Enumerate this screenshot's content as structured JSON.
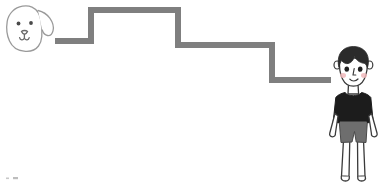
{
  "scene": {
    "title": "Illustration of a dog and a boy separated by a descending step line",
    "width": 387,
    "height": 185,
    "background_color": "#ffffff",
    "caption": ""
  },
  "palette": {
    "step_line": "#7f7f7f",
    "outline": "#3a3a3a",
    "sketch_outline": "#9a9a9a",
    "hair": "#2b2b2b",
    "shirt": "#1c1c1c",
    "shorts": "#6e6e6e",
    "skin": "#fdfdfd",
    "cheek": "#f0b9bb",
    "eye": "#202020",
    "white": "#ffffff"
  },
  "step_line": {
    "name": "step-line",
    "stroke_color": "#7f7f7f",
    "stroke_width": 6,
    "points": [
      [
        55,
        41
      ],
      [
        91,
        41
      ],
      [
        91,
        10
      ],
      [
        178,
        10
      ],
      [
        178,
        45
      ],
      [
        272,
        45
      ],
      [
        272,
        80
      ],
      [
        331,
        80
      ]
    ],
    "steps_down": 3
  },
  "dog": {
    "name": "dog",
    "label": "dog-head",
    "position": {
      "x": 4,
      "y": 4,
      "width": 52,
      "height": 48
    },
    "outline_color": "#9a9a9a",
    "fill_color": "#ffffff",
    "features": [
      "head",
      "floppy-ear",
      "left-eye",
      "right-eye",
      "nose",
      "mouth"
    ]
  },
  "boy": {
    "name": "boy",
    "label": "standing-boy",
    "position": {
      "x": 326,
      "y": 46,
      "width": 58,
      "height": 136
    },
    "hair_color": "#2b2b2b",
    "shirt_color": "#1c1c1c",
    "shorts_color": "#6e6e6e",
    "skin_color": "#fdfdfd",
    "cheek_color": "#f0b9bb",
    "features": [
      "hair",
      "left-ear",
      "right-ear",
      "left-eye",
      "right-eye",
      "nose",
      "smile",
      "left-cheek",
      "right-cheek",
      "neck",
      "tshirt",
      "left-arm",
      "right-arm",
      "shorts",
      "left-leg",
      "right-leg"
    ]
  },
  "corner_mark": {
    "name": "corner-mark",
    "position": {
      "x": 6,
      "y": 176
    },
    "color": "#c8c8c8"
  }
}
